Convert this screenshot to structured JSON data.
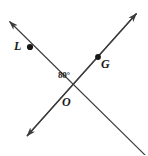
{
  "figure": {
    "kind": "geometry-diagram",
    "background_color": "#ffffff",
    "stroke_color": "#3b3b3b",
    "label_color": "#1a1a1a",
    "width": 148,
    "height": 155,
    "labels": {
      "point_L": "L",
      "point_G": "G",
      "point_O": "O",
      "angle": "80°"
    },
    "points": [
      {
        "name": "L",
        "x": 30,
        "y": 47
      },
      {
        "name": "G",
        "x": 98,
        "y": 57
      },
      {
        "name": "O",
        "x": 68,
        "y": 90
      }
    ],
    "lines": [
      {
        "name": "line-L",
        "from": {
          "x": 8,
          "y": 20
        },
        "to": {
          "x": 148,
          "y": 157
        },
        "arrow_start": true,
        "arrow_end": false
      },
      {
        "name": "line-G",
        "from": {
          "x": 138,
          "y": 12
        },
        "to": {
          "x": 25,
          "y": 138
        },
        "arrow_start": true,
        "arrow_end": true
      }
    ],
    "angle_value": "80°"
  }
}
